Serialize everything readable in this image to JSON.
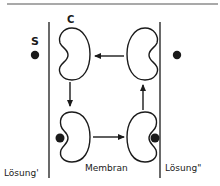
{
  "diagram": {
    "type": "carrier-transport-cycle",
    "labels": {
      "substrate": "S",
      "carrier": "C",
      "left_compartment": "Lösung'",
      "membrane": "Membran",
      "right_compartment": "Lösung\""
    },
    "nodes": [
      {
        "id": "carrier-top-left",
        "state": "empty, open to Lösung'"
      },
      {
        "id": "carrier-top-right",
        "state": "empty, open to Lösung\""
      },
      {
        "id": "carrier-bottom-left",
        "state": "bound S, open to Lösung'"
      },
      {
        "id": "carrier-bottom-right",
        "state": "bound S, open to Lösung\""
      }
    ],
    "edges": [
      {
        "from": "carrier-top-right",
        "to": "carrier-top-left",
        "direction": "left"
      },
      {
        "from": "carrier-top-left",
        "to": "carrier-bottom-left",
        "direction": "down"
      },
      {
        "from": "carrier-bottom-left",
        "to": "carrier-bottom-right",
        "direction": "right"
      },
      {
        "from": "carrier-bottom-right",
        "to": "carrier-top-right",
        "direction": "up"
      }
    ],
    "free_substrate": [
      {
        "side": "left",
        "label": "S"
      },
      {
        "side": "right",
        "label": ""
      }
    ],
    "colors": {
      "stroke": "#1a1a1a",
      "background": "#ffffff"
    }
  }
}
